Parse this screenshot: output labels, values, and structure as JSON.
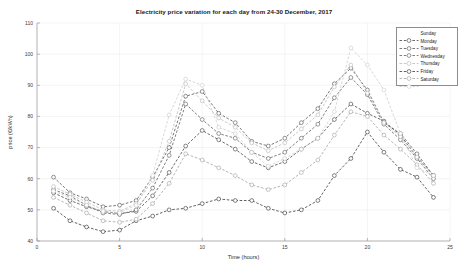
{
  "chart_data": {
    "type": "line",
    "title": "Electricity price variation for each day from 24-30 December, 2017",
    "xlabel": "Time (hours)",
    "ylabel": "price (€/kWh)",
    "xlim": [
      0,
      25
    ],
    "ylim": [
      40,
      110
    ],
    "xticks": [
      0,
      5,
      10,
      15,
      20,
      25
    ],
    "yticks": [
      40,
      50,
      60,
      70,
      80,
      90,
      100,
      110
    ],
    "grid": true,
    "legend_position": "top-right",
    "marker": "circle",
    "linestyle": "dashed",
    "x": [
      1,
      2,
      3,
      4,
      5,
      6,
      7,
      8,
      9,
      10,
      11,
      12,
      13,
      14,
      15,
      16,
      17,
      18,
      19,
      20,
      21,
      22,
      23,
      24
    ],
    "series": [
      {
        "name": "Sunday",
        "color": "#3a3a3a",
        "values": [
          55.5,
          53.0,
          51.0,
          49.5,
          48.8,
          49.5,
          54.5,
          62.0,
          70.5,
          75.5,
          72.5,
          69.5,
          65.5,
          63.5,
          65.5,
          69.5,
          73.0,
          79.0,
          84.0,
          81.0,
          78.5,
          74.0,
          67.0,
          61.0
        ]
      },
      {
        "name": "Monday",
        "color": "#4a4a4a",
        "values": [
          60.5,
          55.5,
          53.5,
          51.0,
          51.5,
          53.0,
          60.5,
          70.0,
          86.5,
          88.0,
          81.0,
          78.0,
          72.0,
          70.5,
          73.0,
          78.0,
          82.5,
          90.5,
          95.5,
          88.5,
          78.0,
          74.5,
          68.0,
          61.0
        ]
      },
      {
        "name": "Tuesday",
        "color": "#555555",
        "values": [
          56.5,
          54.5,
          51.5,
          49.0,
          48.5,
          50.0,
          57.0,
          67.5,
          84.0,
          79.0,
          74.5,
          73.0,
          68.5,
          66.5,
          68.5,
          73.0,
          77.5,
          86.0,
          92.5,
          87.0,
          77.5,
          72.5,
          66.5,
          60.0
        ]
      },
      {
        "name": "Wednesday",
        "color": "#b5b5b5",
        "values": [
          57.5,
          55.0,
          52.5,
          50.0,
          49.5,
          52.0,
          59.5,
          72.0,
          90.5,
          85.0,
          79.5,
          76.5,
          71.5,
          69.0,
          71.5,
          76.0,
          80.5,
          89.5,
          96.5,
          87.5,
          78.0,
          73.5,
          67.0,
          61.0
        ]
      },
      {
        "name": "Thursday",
        "color": "#2e2e2e",
        "values": [
          50.5,
          46.5,
          44.5,
          43.0,
          43.5,
          46.5,
          48.0,
          50.0,
          50.5,
          52.0,
          53.5,
          53.0,
          53.0,
          50.5,
          49.0,
          50.0,
          53.0,
          61.0,
          66.5,
          75.0,
          68.5,
          63.0,
          60.5,
          54.0
        ]
      },
      {
        "name": "Friday",
        "color": "#9d9d9d",
        "values": [
          54.0,
          51.5,
          49.0,
          46.5,
          46.0,
          47.0,
          52.0,
          58.5,
          68.0,
          66.0,
          63.5,
          61.0,
          58.0,
          56.5,
          58.0,
          62.0,
          66.0,
          74.0,
          81.5,
          80.0,
          74.0,
          69.5,
          64.5,
          58.5
        ]
      },
      {
        "name": "Saturday",
        "color": "#c9c9c9",
        "values": [
          56.0,
          54.0,
          51.5,
          49.5,
          49.0,
          51.5,
          61.0,
          80.5,
          92.0,
          90.0,
          76.5,
          74.5,
          68.5,
          64.0,
          66.5,
          69.5,
          73.0,
          81.5,
          102.0,
          96.5,
          88.5,
          74.5,
          63.5,
          61.0
        ]
      }
    ]
  }
}
